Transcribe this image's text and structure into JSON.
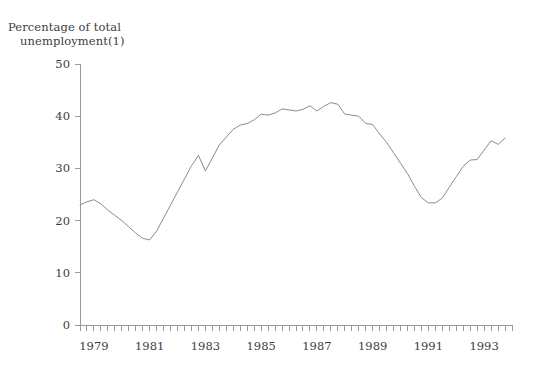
{
  "chart_data": {
    "type": "line",
    "title": "Percentage of total unemployment(1)",
    "title_line1": "Percentage of total",
    "title_line2": "unemployment(1)",
    "xlabel": "",
    "ylabel": "",
    "ylim": [
      0,
      50
    ],
    "yticks": [
      0,
      10,
      20,
      30,
      40,
      50
    ],
    "ytick_labels": [
      "0",
      "10",
      "20",
      "30",
      "40",
      "50"
    ],
    "xlim": [
      1978.5,
      1994.0
    ],
    "xtick_labels": [
      "1979",
      "1981",
      "1983",
      "1985",
      "1987",
      "1989",
      "1991",
      "1993"
    ],
    "xtick_positions": [
      1979.0,
      1981.0,
      1983.0,
      1985.0,
      1987.0,
      1989.0,
      1991.0,
      1993.0
    ],
    "minor_tick_interval": 0.25,
    "grid": false,
    "legend": null,
    "line_color": "#8c8c8c",
    "axis_color": "#9a9a9a",
    "text_color": "#3d3d3d",
    "background": "#ffffff",
    "series": [
      {
        "name": "Percentage of total unemployment",
        "x": [
          1978.5,
          1978.75,
          1979.0,
          1979.25,
          1979.5,
          1979.75,
          1980.0,
          1980.25,
          1980.5,
          1980.75,
          1981.0,
          1981.25,
          1981.5,
          1981.75,
          1982.0,
          1982.25,
          1982.5,
          1982.75,
          1983.0,
          1983.25,
          1983.5,
          1983.75,
          1984.0,
          1984.25,
          1984.5,
          1984.75,
          1985.0,
          1985.25,
          1985.5,
          1985.75,
          1986.0,
          1986.25,
          1986.5,
          1986.75,
          1987.0,
          1987.25,
          1987.5,
          1987.75,
          1988.0,
          1988.25,
          1988.5,
          1988.75,
          1989.0,
          1989.25,
          1989.5,
          1989.75,
          1990.0,
          1990.25,
          1990.5,
          1990.75,
          1991.0,
          1991.25,
          1991.5,
          1991.75,
          1992.0,
          1992.25,
          1992.5,
          1992.75,
          1993.0,
          1993.25,
          1993.5,
          1993.75
        ],
        "values": [
          23.0,
          23.6,
          24.0,
          23.2,
          22.0,
          21.0,
          20.0,
          18.8,
          17.6,
          16.6,
          16.3,
          18.0,
          20.5,
          23.0,
          25.5,
          28.0,
          30.5,
          32.5,
          29.5,
          32.0,
          34.5,
          36.0,
          37.5,
          38.3,
          38.6,
          39.3,
          40.4,
          40.2,
          40.6,
          41.4,
          41.2,
          41.0,
          41.3,
          42.0,
          41.0,
          41.9,
          42.6,
          42.3,
          40.4,
          40.2,
          40.0,
          38.6,
          38.4,
          36.6,
          35.0,
          33.0,
          31.0,
          29.0,
          26.6,
          24.4,
          23.4,
          23.4,
          24.3,
          26.4,
          28.4,
          30.4,
          31.6,
          31.7,
          33.5,
          35.3,
          34.6,
          35.8
        ]
      }
    ]
  }
}
